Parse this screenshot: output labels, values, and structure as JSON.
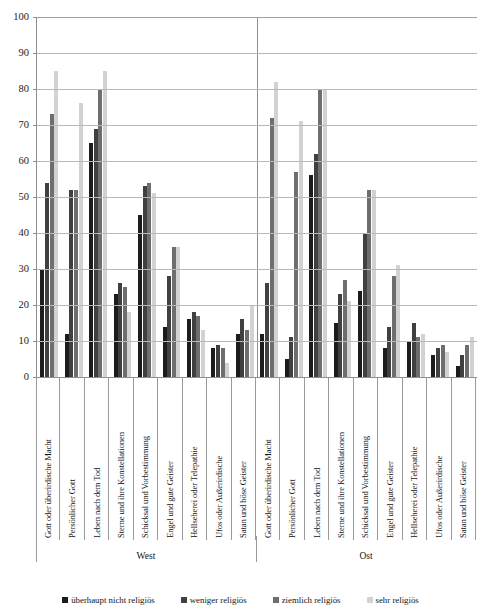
{
  "chart_data": {
    "type": "bar",
    "title": "",
    "subtitle": "",
    "xlabel": "",
    "ylabel": "",
    "ylim": [
      0,
      100
    ],
    "yticks": [
      0,
      10,
      20,
      30,
      40,
      50,
      60,
      70,
      80,
      90,
      100
    ],
    "grid": true,
    "legend_position": "bottom",
    "group_labels": [
      "West",
      "Ost"
    ],
    "categories": [
      "Gott oder überirdische Macht",
      "Persönlicher Gott",
      "Leben nach dem Tod",
      "Sterne und ihre Konstellationen",
      "Schicksal und Vorbestimmung",
      "Engel und gute Geister",
      "Hellseherei oder Telepathie",
      "Ufos oder Außerirdische",
      "Satan und böse Geister"
    ],
    "series": [
      {
        "name": "überhaupt nicht religiös",
        "color": "#1c1c1c",
        "values_west": [
          30,
          12,
          65,
          23,
          45,
          14,
          16,
          8,
          12
        ],
        "values_ost": [
          12,
          5,
          56,
          15,
          24,
          8,
          10,
          6,
          3
        ]
      },
      {
        "name": "weniger religiös",
        "color": "#404040",
        "values_west": [
          54,
          52,
          69,
          26,
          53,
          28,
          18,
          9,
          16
        ],
        "values_ost": [
          26,
          11,
          62,
          23,
          40,
          14,
          15,
          8,
          6
        ]
      },
      {
        "name": "ziemlich religiös",
        "color": "#6e6e6e",
        "values_west": [
          73,
          52,
          80,
          25,
          54,
          36,
          17,
          8,
          13
        ],
        "values_ost": [
          72,
          57,
          80,
          27,
          52,
          28,
          11,
          9,
          9
        ]
      },
      {
        "name": "sehr religiös",
        "color": "#d2d2d2",
        "values_west": [
          85,
          76,
          85,
          18,
          51,
          36,
          13,
          4,
          20
        ],
        "values_ost": [
          82,
          71,
          80,
          21,
          52,
          31,
          12,
          7,
          11
        ]
      }
    ]
  },
  "axis": {
    "tick_labels": [
      "100",
      "90",
      "80",
      "70",
      "60",
      "50",
      "40",
      "30",
      "20",
      "10",
      "0"
    ]
  },
  "legend": {
    "items": [
      {
        "label": "überhaupt nicht religiös",
        "color": "#1c1c1c"
      },
      {
        "label": "weniger religiös",
        "color": "#404040"
      },
      {
        "label": "ziemlich religiös",
        "color": "#6e6e6e"
      },
      {
        "label": "sehr religiös",
        "color": "#d2d2d2"
      }
    ]
  }
}
